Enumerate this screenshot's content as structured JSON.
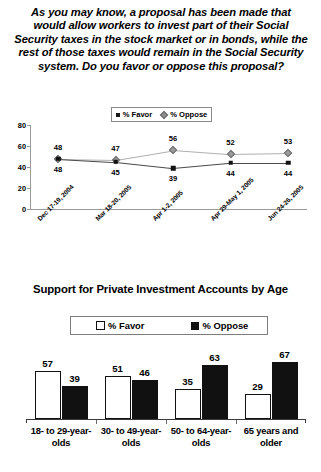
{
  "question": "As you may know, a proposal has been made that would allow workers to invest part of their Social Security taxes in the stock market or in bonds, while the rest of those taxes would remain in the Social Security system. Do you favor or oppose this proposal?",
  "chart_data": [
    {
      "type": "line",
      "title": "",
      "legend": [
        "% Favor",
        "% Oppose"
      ],
      "legend_position": "top-center",
      "categories": [
        "Dec 17-19, 2004",
        "Mar 18-20, 2005",
        "Apr 1-2, 2005",
        "Apr 29-May 1, 2005",
        "Jun 24-26, 2005"
      ],
      "series": [
        {
          "name": "% Favor",
          "values": [
            48,
            45,
            39,
            44,
            44
          ],
          "marker": "square",
          "color": "#111111"
        },
        {
          "name": "% Oppose",
          "values": [
            48,
            47,
            56,
            52,
            53
          ],
          "marker": "diamond",
          "color": "#9c9c9c"
        }
      ],
      "yticks": [
        "0",
        "20",
        "40",
        "60",
        "80"
      ],
      "ylim": [
        0,
        80
      ],
      "xlabel": "",
      "ylabel": "",
      "grid": false
    },
    {
      "type": "bar",
      "title": "Support for Private Investment Accounts by Age",
      "legend": [
        "% Favor",
        "% Oppose"
      ],
      "legend_position": "top-center",
      "categories": [
        "18- to 29-year-olds",
        "30- to 49-year-olds",
        "50- to 64-year-olds",
        "65 years and older"
      ],
      "series": [
        {
          "name": "% Favor",
          "values": [
            57,
            51,
            35,
            29
          ],
          "color": "#ffffff"
        },
        {
          "name": "% Oppose",
          "values": [
            39,
            46,
            63,
            67
          ],
          "color": "#111111"
        }
      ],
      "ylim": [
        0,
        80
      ],
      "xlabel": "",
      "ylabel": "",
      "grid": false
    }
  ]
}
